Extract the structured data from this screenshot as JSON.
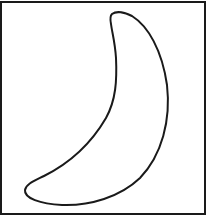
{
  "figure": {
    "shape": "crescent-moon-outline",
    "stroke_color": "#1a1a1a",
    "fill_color": "#ffffff",
    "border_color": "#1a1a1a",
    "background": "#ffffff"
  }
}
